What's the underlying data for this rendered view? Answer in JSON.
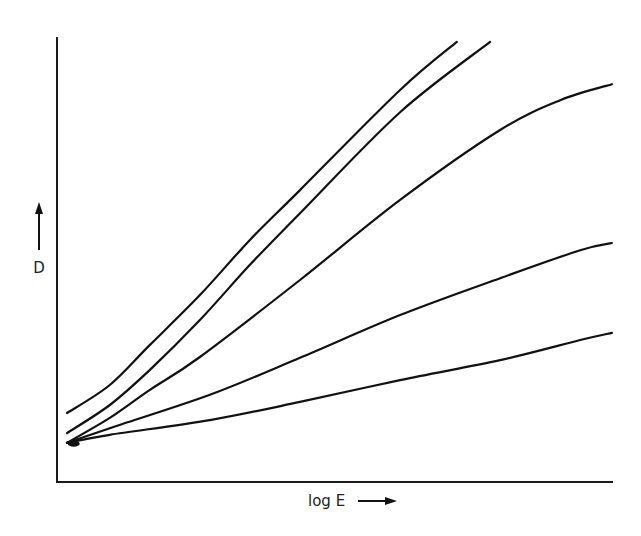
{
  "page_header": "",
  "chart_data": {
    "type": "line",
    "title": "",
    "xlabel": "log E",
    "ylabel": "D",
    "xlim": [
      0,
      10
    ],
    "ylim": [
      0,
      10
    ],
    "grid": false,
    "legend": "none",
    "axis_ticks": "none",
    "units_note": "relative units (no tick labels shown)",
    "series": [
      {
        "name": "curve-1",
        "x": [
          0.18,
          0.95,
          1.67,
          2.57,
          3.47,
          4.37,
          6.17,
          7.19
        ],
        "y": [
          1.55,
          2.18,
          3.08,
          4.2,
          5.44,
          6.56,
          8.81,
          9.89
        ]
      },
      {
        "name": "curve-2",
        "x": [
          0.18,
          0.95,
          1.67,
          2.57,
          3.47,
          4.37,
          6.17,
          7.79
        ],
        "y": [
          1.1,
          1.73,
          2.52,
          3.64,
          4.88,
          6.04,
          8.31,
          9.89
        ]
      },
      {
        "name": "curve-3",
        "x": [
          0.18,
          0.95,
          1.67,
          2.57,
          4.37,
          6.17,
          7.97,
          9.05,
          9.98
        ],
        "y": [
          0.88,
          1.44,
          2.07,
          2.81,
          4.54,
          6.34,
          7.91,
          8.58,
          8.94
        ]
      },
      {
        "name": "curve-4",
        "x": [
          0.18,
          0.95,
          2.75,
          4.37,
          6.17,
          7.97,
          9.41,
          9.98
        ],
        "y": [
          0.88,
          1.21,
          1.96,
          2.79,
          3.75,
          4.58,
          5.21,
          5.37
        ]
      },
      {
        "name": "curve-5",
        "x": [
          0.18,
          0.95,
          2.75,
          4.37,
          6.17,
          7.97,
          9.41,
          9.98
        ],
        "y": [
          0.88,
          1.06,
          1.39,
          1.8,
          2.29,
          2.74,
          3.19,
          3.35
        ]
      }
    ]
  }
}
